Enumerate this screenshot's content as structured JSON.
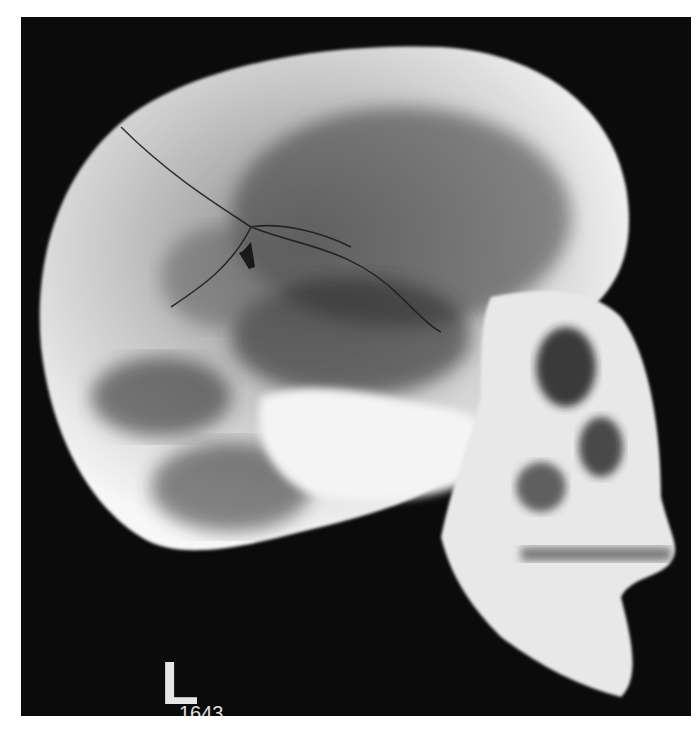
{
  "image": {
    "type": "radiograph",
    "subject": "lateral skull x-ray",
    "background_color": "#0b0b0b",
    "bone_color": "#f2f2f2"
  },
  "labels": {
    "side_marker": "L",
    "film_number": "1643"
  },
  "annotations": [
    {
      "type": "arrow",
      "color": "#1a1a1a",
      "points_to": "fracture line"
    }
  ]
}
